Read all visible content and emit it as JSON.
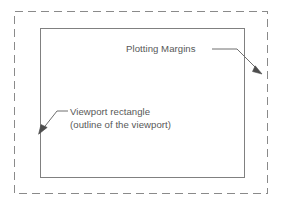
{
  "figure": {
    "background_color": "#ffffff",
    "annotations": [
      {
        "id": "plotting-margins",
        "text": "Plotting Margins",
        "text_x": 126,
        "text_y": 52,
        "color": "#585858",
        "leader": "M 212 49 L 237 49 L 262 74",
        "arrow_tip_x": 262,
        "arrow_tip_y": 74,
        "arrow_angle_deg": 45
      },
      {
        "id": "viewport-rectangle",
        "text_line_1": "Viewport rectangle",
        "text_line_2": "(outline of the viewport)",
        "text_x": 70,
        "text_y_line_1": 115,
        "text_y_line_2": 128,
        "color": "#585858",
        "leader": "M 68 111 L 57 111 L 39 133",
        "arrow_tip_x": 39,
        "arrow_tip_y": 133,
        "arrow_angle_deg": 230
      }
    ],
    "shapes": [
      {
        "id": "plotting-margins-border",
        "kind": "dashed-rectangle",
        "x": 14,
        "y": 11,
        "width": 254,
        "height": 183,
        "stroke": "#8a8a8a",
        "stroke_width": 1,
        "dash": "8 5"
      },
      {
        "id": "viewport-border",
        "kind": "solid-rectangle",
        "x": 40,
        "y": 28,
        "width": 205,
        "height": 150,
        "stroke": "#808080",
        "stroke_width": 1,
        "fill": "none"
      }
    ]
  }
}
